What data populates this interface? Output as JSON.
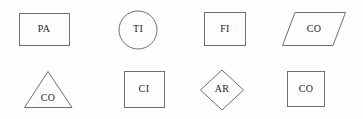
{
  "canvas": {
    "width": 363,
    "height": 119,
    "background_color": "#fefefe",
    "stroke_color": "#6f6f6f",
    "label_color": "#1d1d1d"
  },
  "shapes": [
    {
      "id": "rectangle-pa",
      "kind": "rectangle",
      "label": "PA",
      "row": 1,
      "column": 1,
      "x": 19,
      "y": 13,
      "width": 51,
      "height": 33,
      "label_x": 44,
      "label_y": 30
    },
    {
      "id": "circle-ti",
      "kind": "circle",
      "label": "TI",
      "row": 1,
      "column": 2,
      "cx": 138,
      "cy": 30,
      "r": 19,
      "label_x": 138,
      "label_y": 30
    },
    {
      "id": "square-fi",
      "kind": "square",
      "label": "FI",
      "row": 1,
      "column": 3,
      "x": 204,
      "y": 12,
      "width": 42,
      "height": 34,
      "label_x": 225,
      "label_y": 30
    },
    {
      "id": "parallelogram-co",
      "kind": "parallelogram",
      "label": "CO",
      "row": 1,
      "column": 4,
      "points": "295,12 346,12 333,46 282,46",
      "label_x": 314,
      "label_y": 30
    },
    {
      "id": "triangle-co",
      "kind": "triangle",
      "label": "CO",
      "row": 2,
      "column": 1,
      "points": "48,72 72,108 25,108",
      "label_x": 48,
      "label_y": 99
    },
    {
      "id": "square-ci",
      "kind": "square",
      "label": "CI",
      "row": 2,
      "column": 2,
      "x": 124,
      "y": 71,
      "width": 41,
      "height": 37,
      "label_x": 144,
      "label_y": 90
    },
    {
      "id": "diamond-ar",
      "kind": "diamond",
      "label": "AR",
      "row": 2,
      "column": 3,
      "points": "222,70 244,90 222,110 200,90",
      "label_x": 222,
      "label_y": 90
    },
    {
      "id": "square-co",
      "kind": "square",
      "label": "CO",
      "row": 2,
      "column": 4,
      "x": 287,
      "y": 71,
      "width": 38,
      "height": 36,
      "label_x": 306,
      "label_y": 90
    }
  ]
}
